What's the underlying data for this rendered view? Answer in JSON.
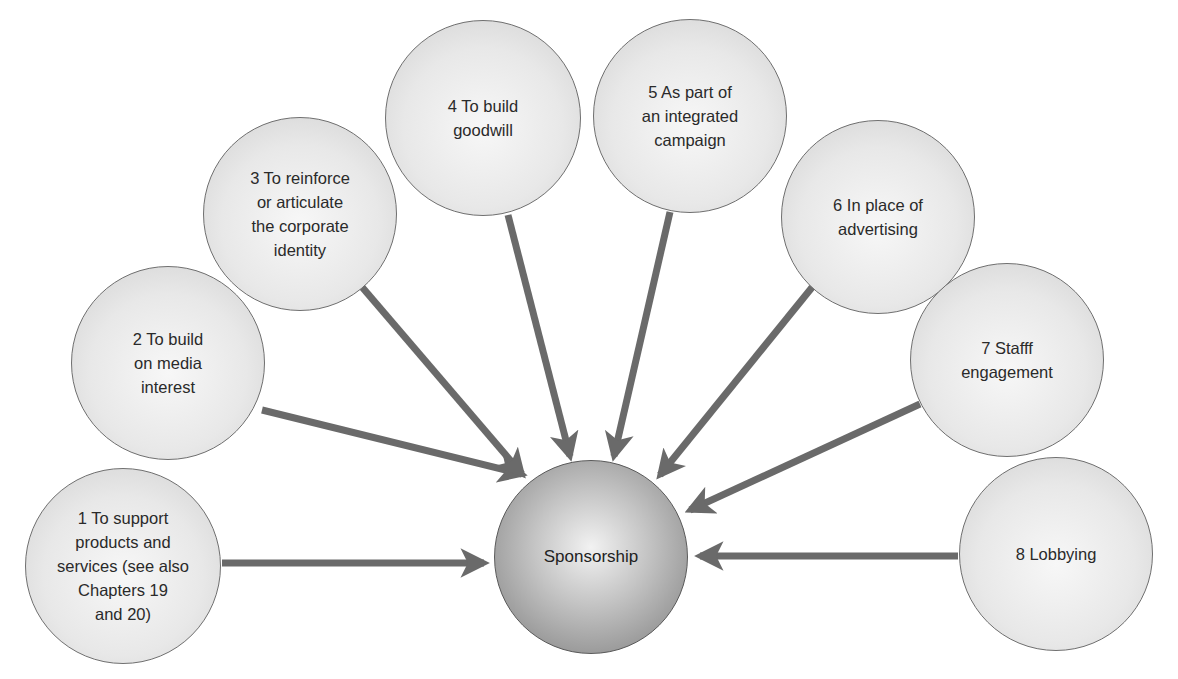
{
  "diagram": {
    "type": "hub-and-spoke",
    "colors": {
      "arrow": "#6a6a6a",
      "node_border": "#6f6f6f",
      "background": "#ffffff"
    },
    "center": {
      "label": "Sponsorship",
      "cx": 591,
      "cy": 557,
      "r": 97
    },
    "nodes": [
      {
        "id": 1,
        "label": "1 To support\nproducts and\nservices (see also\nChapters 19\nand 20)",
        "cx": 123,
        "cy": 566,
        "r": 98
      },
      {
        "id": 2,
        "label": "2 To build\non media\ninterest",
        "cx": 168,
        "cy": 363,
        "r": 97
      },
      {
        "id": 3,
        "label": "3 To reinforce\nor articulate\nthe corporate\nidentity",
        "cx": 300,
        "cy": 214,
        "r": 97
      },
      {
        "id": 4,
        "label": "4 To build\ngoodwill",
        "cx": 483,
        "cy": 118,
        "r": 98
      },
      {
        "id": 5,
        "label": "5 As part of\nan integrated\ncampaign",
        "cx": 690,
        "cy": 116,
        "r": 97
      },
      {
        "id": 6,
        "label": "6 In place of\nadvertising",
        "cx": 878,
        "cy": 217,
        "r": 97
      },
      {
        "id": 7,
        "label": "7 Stafff\nengagement",
        "cx": 1007,
        "cy": 360,
        "r": 97
      },
      {
        "id": 8,
        "label": "8 Lobbying",
        "cx": 1056,
        "cy": 554,
        "r": 97
      }
    ],
    "arrows": [
      {
        "from": 1,
        "x1": 222,
        "y1": 563,
        "x2": 484,
        "y2": 563
      },
      {
        "from": 2,
        "x1": 262,
        "y1": 410,
        "x2": 522,
        "y2": 474
      },
      {
        "from": 3,
        "x1": 362,
        "y1": 287,
        "x2": 522,
        "y2": 474
      },
      {
        "from": 4,
        "x1": 508,
        "y1": 215,
        "x2": 570,
        "y2": 456
      },
      {
        "from": 5,
        "x1": 670,
        "y1": 212,
        "x2": 614,
        "y2": 456
      },
      {
        "from": 6,
        "x1": 818,
        "y1": 280,
        "x2": 660,
        "y2": 475
      },
      {
        "from": 7,
        "x1": 920,
        "y1": 404,
        "x2": 690,
        "y2": 510
      },
      {
        "from": 8,
        "x1": 958,
        "y1": 556,
        "x2": 700,
        "y2": 556
      }
    ]
  }
}
